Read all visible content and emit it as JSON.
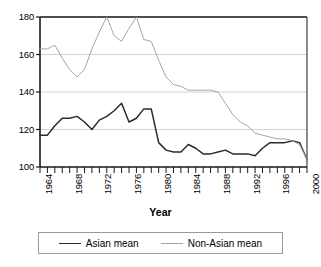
{
  "chart_data": {
    "type": "line",
    "title": "",
    "xlabel": "Year",
    "ylabel": "",
    "xlim": [
      1964,
      2000
    ],
    "ylim": [
      100,
      180
    ],
    "yticks": [
      100,
      120,
      140,
      160,
      180
    ],
    "xticks": [
      1964,
      1968,
      1972,
      1976,
      1980,
      1984,
      1988,
      1992,
      1996,
      2000
    ],
    "x_minor_tick_step": 1,
    "grid": "horizontal",
    "legend_position": "below-plot",
    "x": [
      1964,
      1965,
      1966,
      1967,
      1968,
      1969,
      1970,
      1971,
      1972,
      1973,
      1974,
      1975,
      1976,
      1977,
      1978,
      1979,
      1980,
      1981,
      1982,
      1983,
      1984,
      1985,
      1986,
      1987,
      1988,
      1989,
      1990,
      1991,
      1992,
      1993,
      1994,
      1995,
      1996,
      1997,
      1998,
      1999,
      2000
    ],
    "series": [
      {
        "name": "Asian mean",
        "color": "#2b2b2b",
        "width": 1.5,
        "values": [
          117,
          117,
          122,
          126,
          126,
          127,
          124,
          120,
          125,
          127,
          130,
          134,
          124,
          126,
          131,
          131,
          113,
          109,
          108,
          108,
          112,
          110,
          107,
          107,
          108,
          109,
          107,
          107,
          107,
          106,
          110,
          113,
          113,
          113,
          114,
          113,
          104
        ]
      },
      {
        "name": "Non-Asian mean",
        "color": "#a6a6a6",
        "width": 1.0,
        "values": [
          163,
          163,
          165,
          158,
          152,
          148,
          152,
          163,
          172,
          180,
          170,
          167,
          174,
          180,
          168,
          167,
          157,
          148,
          144,
          143,
          141,
          141,
          141,
          141,
          140,
          134,
          128,
          124,
          122,
          118,
          117,
          116,
          115,
          115,
          114,
          112,
          104
        ]
      }
    ]
  },
  "legend": {
    "entries": [
      {
        "label": "Asian mean"
      },
      {
        "label": "Non-Asian mean"
      }
    ]
  },
  "axis": {
    "x_title": "Year",
    "ytick_labels": [
      "180",
      "160",
      "140",
      "120",
      "100"
    ],
    "xtick_labels": [
      "1964",
      "1968",
      "1972",
      "1976",
      "1980",
      "1984",
      "1988",
      "1992",
      "1996",
      "2000"
    ]
  },
  "colors": {
    "series_asian": "#2b2b2b",
    "series_non_asian": "#a6a6a6",
    "gridline": "#c8c8c8",
    "axis": "#1a1a1a",
    "background": "#ffffff"
  }
}
